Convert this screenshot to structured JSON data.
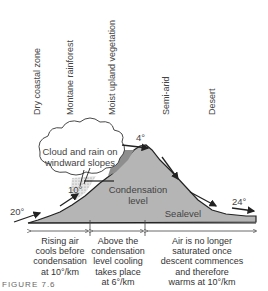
{
  "zones": [
    {
      "label": "Dry coastal zone"
    },
    {
      "label": "Montane rainforest"
    },
    {
      "label": "Moist upland vegetation"
    },
    {
      "label": "Semi-arid"
    },
    {
      "label": "Desert"
    }
  ],
  "cloud_label": "Cloud and rain on windward slopes",
  "cloud_label_lines": [
    "Cloud and rain on",
    "windward slopes"
  ],
  "condensation_label_lines": [
    "Condensation",
    "level"
  ],
  "sealevel_label": "Sealevel",
  "temperatures": {
    "start": "20°",
    "condensation": "10°",
    "summit": "4°",
    "end": "24°"
  },
  "descriptions": [
    {
      "lines": [
        "Rising air",
        "cools before",
        "condensation",
        "at 10°/km"
      ]
    },
    {
      "lines": [
        "Above the",
        "condensation",
        "level cooling",
        "takes place",
        "at 6°/km"
      ]
    },
    {
      "lines": [
        "Air is no longer",
        "saturated once",
        "descent commences",
        "and therefore",
        "warms at 10°/km"
      ]
    }
  ],
  "caption": "FIGURE 7.6",
  "colors": {
    "mountain": "#b3b3b3",
    "mountain_dark": "#8f8f8f",
    "outline": "#222222",
    "cloud_fill": "#ffffff",
    "rain_stipple": "#9a9a9a"
  }
}
